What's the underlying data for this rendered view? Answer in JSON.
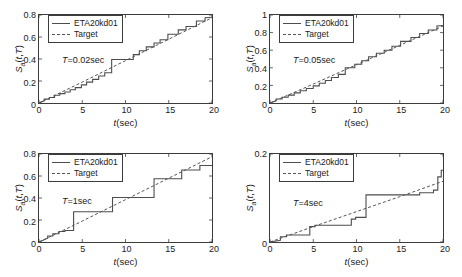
{
  "figure": {
    "series_names": {
      "measured": "ETA20kd01",
      "target": "Target"
    },
    "axis_labels": {
      "y": "S_a(t,T)",
      "x": "t(sec)"
    },
    "colors": {
      "measured_line": "#4d4d4d",
      "target_line": "#555555",
      "axis": "#3c3c3c",
      "background": "#ffffff"
    }
  },
  "panels": [
    {
      "id": "panel-T-0-02",
      "annotation": "T=0.02sec",
      "period_label": "0.02sec",
      "legend": [
        "ETA20kd01",
        "Target"
      ],
      "yticks": [
        "0",
        "0.2",
        "0.4",
        "0.6",
        "0.8"
      ],
      "xticks": [
        "0",
        "5",
        "10",
        "15",
        "20"
      ]
    },
    {
      "id": "panel-T-0-05",
      "annotation": "T=0.05sec",
      "period_label": "0.05sec",
      "legend": [
        "ETA20kd01",
        "Target"
      ],
      "yticks": [
        "0",
        "0.2",
        "0.4",
        "0.6",
        "0.8",
        "1"
      ],
      "xticks": [
        "0",
        "5",
        "10",
        "15",
        "20"
      ]
    },
    {
      "id": "panel-T-1",
      "annotation": "T=1sec",
      "period_label": "1sec",
      "legend": [
        "ETA20kd01",
        "Target"
      ],
      "yticks": [
        "0",
        "0.2",
        "0.4",
        "0.6",
        "0.8"
      ],
      "xticks": [
        "0",
        "5",
        "10",
        "15",
        "20"
      ]
    },
    {
      "id": "panel-T-4",
      "annotation": "T=4sec",
      "period_label": "4sec",
      "legend": [
        "ETA20kd01",
        "Target"
      ],
      "yticks": [
        "0",
        "0.2"
      ],
      "xticks": [
        "0",
        "5",
        "10",
        "15",
        "20"
      ]
    }
  ],
  "chart_data": [
    {
      "type": "line",
      "title": "T=0.02sec",
      "xlabel": "t(sec)",
      "ylabel": "S_a(t,T)",
      "xlim": [
        0,
        20
      ],
      "ylim": [
        0,
        0.8
      ],
      "xticks": [
        0,
        5,
        10,
        15,
        20
      ],
      "yticks": [
        0,
        0.2,
        0.4,
        0.6,
        0.8
      ],
      "grid": false,
      "legend_position": "upper-left",
      "series": [
        {
          "name": "ETA20kd01",
          "style": "solid-staircase",
          "x": [
            0,
            0.6,
            0.6,
            1.2,
            1.2,
            1.8,
            1.8,
            2.4,
            2.4,
            3.0,
            3.0,
            3.6,
            3.6,
            4.2,
            4.2,
            4.9,
            4.9,
            5.5,
            5.5,
            6.2,
            6.2,
            6.9,
            6.9,
            7.6,
            7.6,
            8.4,
            8.4,
            10.9,
            10.9,
            11.6,
            11.6,
            12.4,
            12.4,
            13.3,
            13.3,
            14.0,
            14.0,
            14.9,
            14.9,
            16.1,
            16.1,
            17.0,
            17.0,
            18.2,
            18.2,
            19.2,
            19.2,
            20
          ],
          "y": [
            0.0,
            0.02,
            0.035,
            0.035,
            0.05,
            0.05,
            0.07,
            0.07,
            0.085,
            0.085,
            0.1,
            0.1,
            0.12,
            0.12,
            0.14,
            0.14,
            0.165,
            0.165,
            0.19,
            0.19,
            0.215,
            0.215,
            0.245,
            0.245,
            0.275,
            0.275,
            0.395,
            0.395,
            0.44,
            0.44,
            0.475,
            0.475,
            0.51,
            0.51,
            0.545,
            0.545,
            0.575,
            0.575,
            0.625,
            0.625,
            0.665,
            0.665,
            0.695,
            0.695,
            0.745,
            0.745,
            0.775,
            0.78
          ]
        },
        {
          "name": "Target",
          "style": "dashed",
          "x": [
            0,
            5,
            10,
            15,
            20
          ],
          "y": [
            0.0,
            0.19,
            0.385,
            0.58,
            0.775
          ]
        }
      ]
    },
    {
      "type": "line",
      "title": "T=0.05sec",
      "xlabel": "t(sec)",
      "ylabel": "S_a(t,T)",
      "xlim": [
        0,
        20
      ],
      "ylim": [
        0,
        1
      ],
      "xticks": [
        0,
        5,
        10,
        15,
        20
      ],
      "yticks": [
        0,
        0.2,
        0.4,
        0.6,
        0.8,
        1
      ],
      "grid": false,
      "legend_position": "upper-left",
      "series": [
        {
          "name": "ETA20kd01",
          "style": "solid-staircase",
          "x": [
            0,
            0.7,
            0.7,
            1.4,
            1.4,
            2.1,
            2.1,
            2.8,
            2.8,
            3.5,
            3.5,
            4.2,
            4.2,
            5.0,
            5.0,
            5.7,
            5.7,
            6.4,
            6.4,
            7.1,
            7.1,
            7.9,
            7.9,
            8.7,
            8.7,
            9.8,
            9.8,
            10.6,
            10.6,
            11.4,
            11.4,
            12.3,
            12.3,
            13.2,
            13.2,
            14.1,
            14.1,
            15.1,
            15.1,
            16.3,
            16.3,
            17.3,
            17.3,
            18.3,
            18.3,
            19.3,
            19.3,
            20
          ],
          "y": [
            0.0,
            0.025,
            0.045,
            0.045,
            0.065,
            0.065,
            0.09,
            0.09,
            0.115,
            0.115,
            0.14,
            0.14,
            0.165,
            0.165,
            0.195,
            0.195,
            0.225,
            0.225,
            0.255,
            0.255,
            0.29,
            0.29,
            0.325,
            0.325,
            0.4,
            0.4,
            0.44,
            0.44,
            0.48,
            0.48,
            0.525,
            0.525,
            0.565,
            0.565,
            0.6,
            0.6,
            0.645,
            0.645,
            0.7,
            0.7,
            0.745,
            0.745,
            0.79,
            0.79,
            0.83,
            0.83,
            0.875,
            0.88
          ]
        },
        {
          "name": "Target",
          "style": "dashed",
          "x": [
            0,
            5,
            10,
            15,
            20
          ],
          "y": [
            0.0,
            0.215,
            0.435,
            0.655,
            0.875
          ]
        }
      ]
    },
    {
      "type": "line",
      "title": "T=1sec",
      "xlabel": "t(sec)",
      "ylabel": "S_a(t,T)",
      "xlim": [
        0,
        20
      ],
      "ylim": [
        0,
        0.8
      ],
      "xticks": [
        0,
        5,
        10,
        15,
        20
      ],
      "yticks": [
        0,
        0.2,
        0.4,
        0.6,
        0.8
      ],
      "grid": false,
      "legend_position": "upper-left",
      "series": [
        {
          "name": "ETA20kd01",
          "style": "solid-staircase",
          "x": [
            0,
            1.0,
            1.0,
            1.6,
            1.6,
            2.3,
            2.3,
            3.0,
            3.0,
            4.0,
            4.0,
            8.5,
            8.5,
            13.3,
            13.3,
            16.5,
            16.5,
            18.6,
            18.6,
            20
          ],
          "y": [
            0.0,
            0.035,
            0.055,
            0.055,
            0.075,
            0.075,
            0.095,
            0.095,
            0.105,
            0.105,
            0.275,
            0.275,
            0.405,
            0.405,
            0.575,
            0.575,
            0.655,
            0.655,
            0.695,
            0.695
          ]
        },
        {
          "name": "Target",
          "style": "dashed",
          "x": [
            0,
            5,
            10,
            15,
            20
          ],
          "y": [
            0.0,
            0.19,
            0.385,
            0.58,
            0.775
          ]
        }
      ]
    },
    {
      "type": "line",
      "title": "T=4sec",
      "xlabel": "t(sec)",
      "ylabel": "S_a(t,T)",
      "xlim": [
        0,
        20
      ],
      "ylim": [
        0,
        0.2
      ],
      "xticks": [
        0,
        5,
        10,
        15,
        20
      ],
      "yticks": [
        0,
        0.2
      ],
      "grid": false,
      "legend_position": "upper-left",
      "series": [
        {
          "name": "ETA20kd01",
          "style": "solid-staircase",
          "x": [
            0,
            1.2,
            1.2,
            1.9,
            1.9,
            4.6,
            4.6,
            5.2,
            5.2,
            9.4,
            9.4,
            9.9,
            9.9,
            11.1,
            11.1,
            17.3,
            17.3,
            18.9,
            18.9,
            19.4,
            19.4,
            19.8,
            19.8,
            20
          ],
          "y": [
            0.0,
            0.004,
            0.012,
            0.012,
            0.016,
            0.016,
            0.035,
            0.035,
            0.038,
            0.038,
            0.052,
            0.052,
            0.056,
            0.056,
            0.107,
            0.107,
            0.112,
            0.112,
            0.118,
            0.118,
            0.148,
            0.148,
            0.163,
            0.163
          ]
        },
        {
          "name": "Target",
          "style": "dashed",
          "x": [
            0,
            5,
            10,
            15,
            20
          ],
          "y": [
            0.0,
            0.035,
            0.069,
            0.103,
            0.138
          ]
        }
      ]
    }
  ]
}
